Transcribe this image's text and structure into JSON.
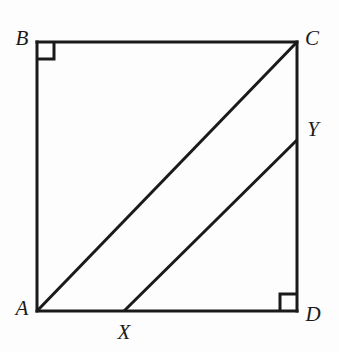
{
  "figure": {
    "shape_type": "square",
    "background_color": "#fdfdfd",
    "stroke_color": "#1a1a1a",
    "stroke_width": 3,
    "canvas": {
      "width": 339,
      "height": 352
    },
    "vertices": [
      {
        "id": "A",
        "label": "A",
        "x": 37,
        "y": 311,
        "label_x": 22,
        "label_y": 308
      },
      {
        "id": "B",
        "label": "B",
        "x": 37,
        "y": 42,
        "label_x": 22,
        "label_y": 38
      },
      {
        "id": "C",
        "label": "C",
        "x": 297,
        "y": 42,
        "label_x": 312,
        "label_y": 38
      },
      {
        "id": "D",
        "label": "D",
        "x": 297,
        "y": 311,
        "label_x": 313,
        "label_y": 314
      }
    ],
    "points": [
      {
        "id": "X",
        "label": "X",
        "x": 124,
        "y": 311,
        "on_edge": "AD",
        "label_x": 124,
        "label_y": 332
      },
      {
        "id": "Y",
        "label": "Y",
        "x": 297,
        "y": 140,
        "on_edge": "CD",
        "label_x": 313,
        "label_y": 129
      }
    ],
    "edges": [
      {
        "id": "AB",
        "from": "A",
        "to": "B"
      },
      {
        "id": "BC",
        "from": "B",
        "to": "C"
      },
      {
        "id": "CD",
        "from": "C",
        "to": "D"
      },
      {
        "id": "DA",
        "from": "D",
        "to": "A"
      }
    ],
    "segments": [
      {
        "id": "AC",
        "name": "diagonal-ac",
        "x1": 37,
        "y1": 311,
        "x2": 297,
        "y2": 42
      },
      {
        "id": "XY",
        "name": "segment-xy",
        "x1": 124,
        "y1": 311,
        "x2": 297,
        "y2": 140
      }
    ],
    "right_angle_marks": [
      {
        "id": "angle-B",
        "at": "B",
        "x": 37,
        "y": 42,
        "size": 17,
        "dx": 1,
        "dy": 1
      },
      {
        "id": "angle-D",
        "at": "D",
        "x": 297,
        "y": 311,
        "size": 17,
        "dx": -1,
        "dy": -1
      }
    ]
  }
}
